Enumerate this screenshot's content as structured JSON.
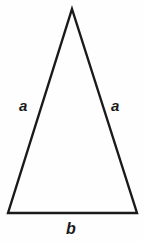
{
  "figure": {
    "kind": "geometry-diagram",
    "shape_name": "isosceles-triangle",
    "background_color": "#fefefe",
    "stroke_color": "#1a1a1a",
    "stroke_width": 2.4,
    "canvas": {
      "width": 143,
      "height": 242
    }
  },
  "chart_data": {
    "type": "diagram",
    "title": "",
    "shape": "isosceles triangle",
    "vertices": [
      {
        "name": "apex",
        "x": 72,
        "y": 9
      },
      {
        "name": "bottom-right",
        "x": 137,
        "y": 213
      },
      {
        "name": "bottom-left",
        "x": 8,
        "y": 213
      }
    ],
    "edges": [
      {
        "name": "left-leg",
        "label": "a",
        "from": "apex",
        "to": "bottom-left"
      },
      {
        "name": "right-leg",
        "label": "a",
        "from": "apex",
        "to": "bottom-right"
      },
      {
        "name": "base",
        "label": "b",
        "from": "bottom-left",
        "to": "bottom-right"
      }
    ],
    "annotations": [
      {
        "text": "a",
        "x": 26,
        "y": 105,
        "style": "italic"
      },
      {
        "text": "a",
        "x": 117,
        "y": 105,
        "style": "italic"
      },
      {
        "text": "b",
        "x": 72,
        "y": 229,
        "style": "italic"
      }
    ],
    "grid": false,
    "legend": null
  },
  "labels": {
    "leg_left": "a",
    "leg_right": "a",
    "base": "b"
  },
  "geometry": {
    "points": "72,9 137,213 8,213"
  }
}
